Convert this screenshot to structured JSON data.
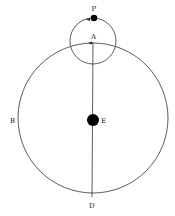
{
  "diagram": {
    "labels": {
      "P": "P",
      "A": "A",
      "B": "B",
      "E": "E",
      "D": "D"
    },
    "colors": {
      "stroke": "#333333",
      "fill": "#000000"
    }
  }
}
